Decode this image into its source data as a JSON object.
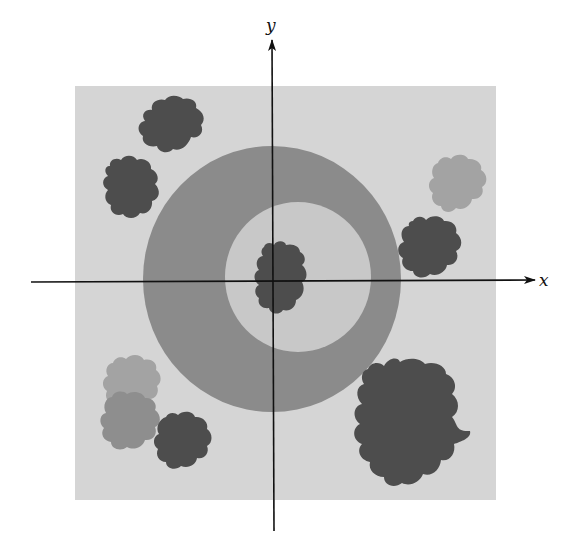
{
  "figure": {
    "axes": {
      "x_label": "x",
      "y_label": "y",
      "origin": [
        273,
        282
      ]
    },
    "colors": {
      "background_square": "#d5d5d5",
      "outer_ring": "#8b8b8b",
      "inner_disk": "#c8c8c8",
      "dark_blob": "#4d4d4d",
      "medium_blob": "#8e8e8e",
      "light_blob": "#a3a3a3",
      "axis": "#111111"
    },
    "square": {
      "x": 75,
      "y": 86,
      "width": 421,
      "height": 414
    },
    "outer_region": {
      "cx": 272,
      "cy": 279,
      "rx": 129,
      "ry": 133
    },
    "inner_region": {
      "cx": 298,
      "cy": 277,
      "rx": 73,
      "ry": 75
    },
    "blobs": [
      {
        "name": "top-left-upper",
        "tone": "dark"
      },
      {
        "name": "top-left-lower",
        "tone": "dark"
      },
      {
        "name": "top-right-upper",
        "tone": "light"
      },
      {
        "name": "right-middle",
        "tone": "dark"
      },
      {
        "name": "center",
        "tone": "dark"
      },
      {
        "name": "bottom-left-upper",
        "tone": "light"
      },
      {
        "name": "bottom-left-middle",
        "tone": "medium"
      },
      {
        "name": "bottom-left-right",
        "tone": "dark"
      },
      {
        "name": "bottom-right-large",
        "tone": "dark"
      }
    ]
  }
}
